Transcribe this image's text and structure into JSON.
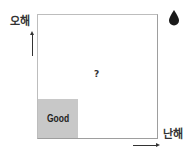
{
  "axes": {
    "y_label": "오해",
    "x_label": "난해"
  },
  "quadrants": {
    "bottom_left": {
      "label": "Good",
      "fill": "#c8c8c8"
    },
    "center": {
      "label": "?"
    }
  },
  "icons": {
    "top_right": "water-drop-icon"
  }
}
